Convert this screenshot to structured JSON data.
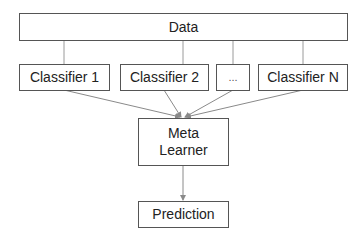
{
  "diagram": {
    "nodes": {
      "data": {
        "label": "Data"
      },
      "classifiers": [
        {
          "label": "Classifier 1"
        },
        {
          "label": "Classifier 2"
        },
        {
          "label": "..."
        },
        {
          "label": "Classifier N"
        }
      ],
      "meta_learner": {
        "label_line1": "Meta",
        "label_line2": "Learner"
      },
      "prediction": {
        "label": "Prediction"
      }
    },
    "edges": [
      {
        "from": "Data",
        "to": "Classifier 1",
        "type": "line"
      },
      {
        "from": "Data",
        "to": "Classifier 2",
        "type": "line"
      },
      {
        "from": "Data",
        "to": "...",
        "type": "line"
      },
      {
        "from": "Data",
        "to": "Classifier N",
        "type": "line"
      },
      {
        "from": "Classifier 1",
        "to": "Meta Learner",
        "type": "arrow"
      },
      {
        "from": "Classifier 2",
        "to": "Meta Learner",
        "type": "arrow"
      },
      {
        "from": "...",
        "to": "Meta Learner",
        "type": "arrow"
      },
      {
        "from": "Classifier N",
        "to": "Meta Learner",
        "type": "arrow"
      },
      {
        "from": "Meta Learner",
        "to": "Prediction",
        "type": "arrow"
      }
    ],
    "colors": {
      "border": "#555555",
      "edge": "#8a8a8a",
      "text": "#222222"
    }
  }
}
